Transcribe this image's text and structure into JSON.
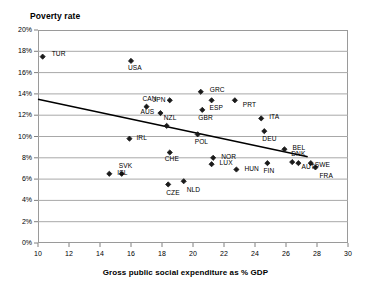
{
  "chart_data": {
    "type": "scatter",
    "title": "Poverty rate",
    "xlabel": "Gross public social expenditure as % GDP",
    "ylabel": "Poverty rate",
    "xlim": [
      10,
      30
    ],
    "ylim": [
      0,
      0.2
    ],
    "grid": true,
    "legend": "none",
    "xticks": [
      "10",
      "12",
      "14",
      "16",
      "18",
      "20",
      "22",
      "24",
      "26",
      "28",
      "30"
    ],
    "xtick_values": [
      10,
      12,
      14,
      16,
      18,
      20,
      22,
      24,
      26,
      28,
      30
    ],
    "yticks": [
      "0%",
      "2%",
      "4%",
      "6%",
      "8%",
      "10%",
      "12%",
      "14%",
      "16%",
      "18%",
      "20%"
    ],
    "ytick_values": [
      0,
      2,
      4,
      6,
      8,
      10,
      12,
      14,
      16,
      18,
      20
    ],
    "marker": "diamond",
    "marker_color": "#1a1a1a",
    "points": [
      {
        "label": "TUR",
        "x": 10.3,
        "y": 17.5,
        "lx": 9,
        "ly": -3
      },
      {
        "label": "USA",
        "x": 16.0,
        "y": 17.1,
        "lx": -3,
        "ly": 7
      },
      {
        "label": "GRC",
        "x": 20.5,
        "y": 14.2,
        "lx": 9,
        "ly": -2
      },
      {
        "label": "CAN",
        "x": 17.0,
        "y": 12.8,
        "lx": -4,
        "ly": -8
      },
      {
        "label": "JPN",
        "x": 18.5,
        "y": 13.4,
        "lx": -17,
        "ly": 0
      },
      {
        "label": "ESP",
        "x": 21.2,
        "y": 13.4,
        "lx": -2,
        "ly": 8
      },
      {
        "label": "PRT",
        "x": 22.7,
        "y": 13.4,
        "lx": 8,
        "ly": 5
      },
      {
        "label": "AUS",
        "x": 17.9,
        "y": 12.2,
        "lx": -20,
        "ly": -1
      },
      {
        "label": "GBR",
        "x": 20.6,
        "y": 12.5,
        "lx": -4,
        "ly": 8
      },
      {
        "label": "ITA",
        "x": 24.4,
        "y": 11.7,
        "lx": 8,
        "ly": -1
      },
      {
        "label": "NZL",
        "x": 18.3,
        "y": 11.0,
        "lx": -3,
        "ly": -8
      },
      {
        "label": "IRL",
        "x": 15.9,
        "y": 9.8,
        "lx": 7,
        "ly": -1
      },
      {
        "label": "POL",
        "x": 20.3,
        "y": 10.2,
        "lx": -3,
        "ly": 8
      },
      {
        "label": "DEU",
        "x": 24.6,
        "y": 10.5,
        "lx": -2,
        "ly": 8
      },
      {
        "label": "CHE",
        "x": 18.5,
        "y": 8.5,
        "lx": -5,
        "ly": 7
      },
      {
        "label": "BEL",
        "x": 25.9,
        "y": 8.8,
        "lx": 8,
        "ly": -1
      },
      {
        "label": "NOR",
        "x": 21.3,
        "y": 8.0,
        "lx": 8,
        "ly": -1
      },
      {
        "label": "LUX",
        "x": 21.2,
        "y": 7.4,
        "lx": 8,
        "ly": -1
      },
      {
        "label": "FIN",
        "x": 24.8,
        "y": 7.5,
        "lx": -4,
        "ly": 8
      },
      {
        "label": "DNK",
        "x": 26.4,
        "y": 7.6,
        "lx": -1,
        "ly": -8
      },
      {
        "label": "AUT",
        "x": 26.8,
        "y": 7.5,
        "lx": 3,
        "ly": 4
      },
      {
        "label": "SWE",
        "x": 27.6,
        "y": 7.5,
        "lx": 4,
        "ly": 2
      },
      {
        "label": "FRA",
        "x": 27.9,
        "y": 7.1,
        "lx": 4,
        "ly": 9
      },
      {
        "label": "HUN",
        "x": 22.8,
        "y": 6.9,
        "lx": 8,
        "ly": -1
      },
      {
        "label": "ISL",
        "x": 14.6,
        "y": 6.5,
        "lx": 8,
        "ly": -1
      },
      {
        "label": "SVK",
        "x": 15.4,
        "y": 6.5,
        "lx": -3,
        "ly": -8
      },
      {
        "label": "CZE",
        "x": 18.4,
        "y": 5.5,
        "lx": -2,
        "ly": 9
      },
      {
        "label": "NLD",
        "x": 19.4,
        "y": 5.8,
        "lx": 3,
        "ly": 9
      }
    ],
    "trendline": {
      "x0": 10.0,
      "y0": 13.5,
      "x1": 27.4,
      "y1": 8.1,
      "color": "#000000",
      "width": 1.6
    }
  }
}
